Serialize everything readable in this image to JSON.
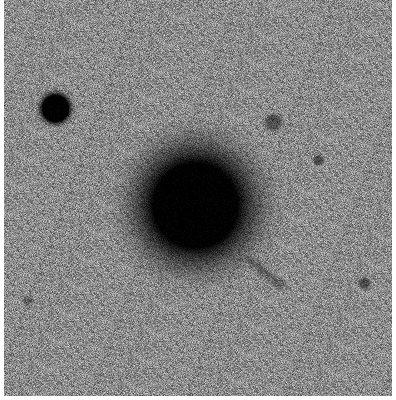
{
  "image": {
    "description": "Inverted grayscale astronomical field: bright elliptical galaxy at center, foreground star at upper left, several faint sources",
    "background_color": "#8c8c8c",
    "frame": {
      "x": 4,
      "y": 0,
      "width": 388,
      "height": 396
    },
    "objects": [
      {
        "name": "central-galaxy",
        "cx": 195,
        "cy": 205,
        "core_r": 42,
        "halo_r": 95,
        "color": "#000000"
      },
      {
        "name": "bright-star",
        "cx": 55,
        "cy": 108,
        "core_r": 13,
        "halo_r": 22,
        "color": "#000000"
      },
      {
        "name": "faint-source-1",
        "cx": 273,
        "cy": 122,
        "core_r": 6,
        "halo_r": 13,
        "color": "#3a3a3a"
      },
      {
        "name": "faint-source-2",
        "cx": 318,
        "cy": 160,
        "core_r": 4,
        "halo_r": 8,
        "color": "#3a3a3a"
      },
      {
        "name": "faint-source-3",
        "cx": 364,
        "cy": 283,
        "core_r": 4,
        "halo_r": 9,
        "color": "#3a3a3a"
      },
      {
        "name": "faint-source-4",
        "cx": 27,
        "cy": 300,
        "core_r": 3,
        "halo_r": 8,
        "color": "#555555"
      }
    ],
    "streak": {
      "name": "tidal-streak",
      "x1": 240,
      "y1": 252,
      "x2": 280,
      "y2": 284,
      "width": 8,
      "color": "#2e2e2e"
    }
  }
}
